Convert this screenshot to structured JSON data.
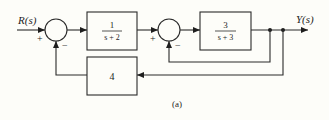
{
  "diagram": {
    "type": "block-diagram",
    "caption": "(a)",
    "input_label": "R(s)",
    "output_label": "Y(s)",
    "blocks": [
      {
        "id": "G1",
        "numerator": "1",
        "denominator": "s + 2"
      },
      {
        "id": "G2",
        "numerator": "3",
        "denominator": "s + 3"
      },
      {
        "id": "H",
        "label": "4"
      }
    ],
    "summing_junctions": [
      {
        "id": "S1",
        "input_sign": "+",
        "feedback_sign": "−"
      },
      {
        "id": "S2",
        "input_sign": "+",
        "feedback_sign": "−"
      }
    ],
    "connections": [
      "R(s) → S1 (+)",
      "S1 → G1",
      "G1 → S2 (+)",
      "S2 → G2",
      "G2 → Y(s)",
      "Y(s) → S2 (−) [unity inner feedback]",
      "Y(s) → H → S1 (−) [outer feedback]"
    ]
  }
}
